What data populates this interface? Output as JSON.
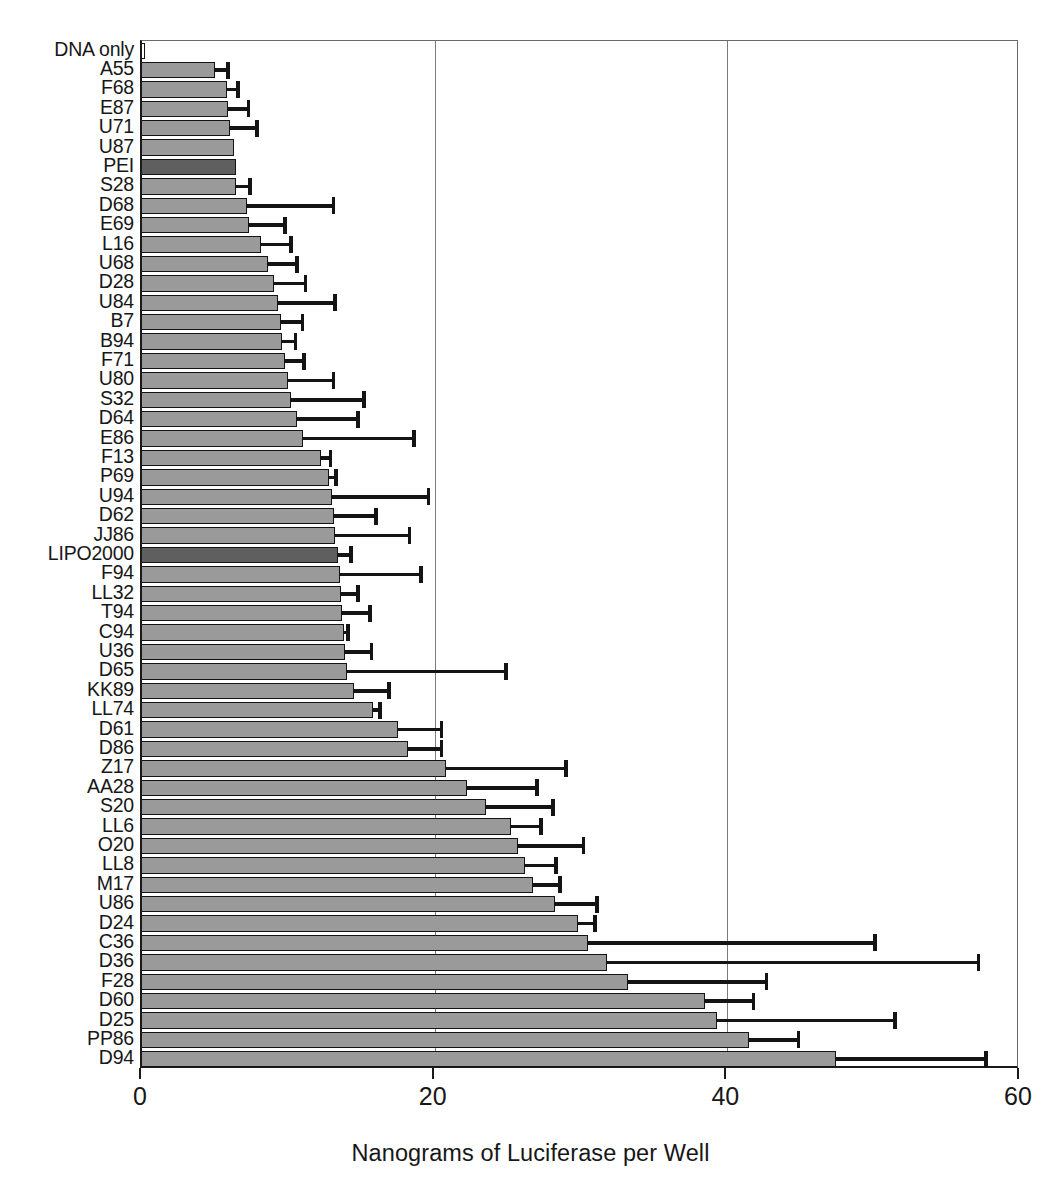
{
  "chart_data": {
    "type": "bar",
    "orientation": "horizontal",
    "title": "",
    "xlabel": "Nanograms of Luciferase per Well",
    "ylabel": "",
    "xlim": [
      0,
      60
    ],
    "xticks": [
      0,
      20,
      40,
      60
    ],
    "xticklabels": [
      "0",
      "20",
      "40",
      "60"
    ],
    "gridlines": [
      20,
      40
    ],
    "grid": true,
    "legend": null,
    "error_bars": "upper only (SEM)",
    "colors": {
      "bar_fill": "#9a9a9a",
      "bar_highlight_fill": "#5f5f5f",
      "bar_edge": "#141414",
      "grid": "#7a7a7a",
      "axis": "#1a1a1a",
      "background": "#ffffff"
    },
    "categories": [
      "DNA only",
      "A55",
      "F68",
      "E87",
      "U71",
      "U87",
      "PEI",
      "S28",
      "D68",
      "E69",
      "L16",
      "U68",
      "D28",
      "U84",
      "B7",
      "B94",
      "F71",
      "U80",
      "S32",
      "D64",
      "E86",
      "F13",
      "P69",
      "U94",
      "D62",
      "JJ86",
      "LIPO2000",
      "F94",
      "LL32",
      "T94",
      "C94",
      "U36",
      "D65",
      "KK89",
      "LL74",
      "D61",
      "D86",
      "Z17",
      "AA28",
      "S20",
      "LL6",
      "O20",
      "LL8",
      "M17",
      "U86",
      "D24",
      "C36",
      "D36",
      "F28",
      "D60",
      "D25",
      "PP86",
      "D94"
    ],
    "values": [
      0.2,
      5.0,
      5.8,
      5.9,
      6.0,
      6.3,
      6.4,
      6.4,
      7.2,
      7.3,
      8.1,
      8.6,
      9.0,
      9.3,
      9.5,
      9.6,
      9.8,
      10.0,
      10.2,
      10.6,
      11.0,
      12.2,
      12.8,
      13.0,
      13.1,
      13.2,
      13.4,
      13.5,
      13.6,
      13.7,
      13.8,
      13.9,
      14.0,
      14.5,
      15.8,
      17.5,
      18.2,
      20.8,
      22.2,
      23.5,
      25.2,
      25.7,
      26.2,
      26.7,
      28.2,
      29.8,
      30.5,
      31.8,
      33.2,
      38.5,
      39.3,
      41.5,
      47.4
    ],
    "error_upper": [
      0.0,
      1.0,
      0.9,
      1.5,
      2.0,
      0.0,
      0.0,
      1.1,
      6.0,
      2.6,
      2.2,
      2.1,
      2.3,
      4.0,
      1.6,
      1.0,
      1.4,
      3.2,
      5.1,
      4.3,
      7.7,
      0.8,
      0.6,
      6.7,
      3.0,
      5.2,
      1.0,
      5.7,
      1.3,
      2.0,
      0.4,
      1.9,
      11.0,
      2.5,
      0.6,
      3.1,
      2.4,
      8.3,
      4.9,
      4.7,
      2.2,
      4.6,
      2.2,
      2.0,
      3.0,
      1.3,
      19.7,
      25.5,
      9.6,
      3.4,
      12.3,
      3.5,
      10.4
    ],
    "highlighted_categories": [
      "PEI",
      "LIPO2000"
    ]
  },
  "axis": {
    "x_title": "Nanograms of Luciferase per Well"
  }
}
